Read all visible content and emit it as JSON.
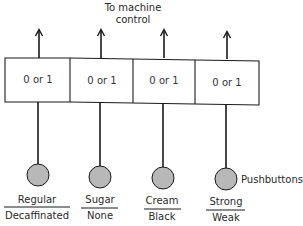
{
  "title": {
    "line1": "To machine control",
    "line1a": "To machine",
    "line2": "control"
  },
  "register": {
    "cells": [
      {
        "value": "0 or 1"
      },
      {
        "value": "0 or 1"
      },
      {
        "value": "0 or 1"
      },
      {
        "value": "0 or 1"
      }
    ]
  },
  "buttons": [
    {
      "top_label": "Regular",
      "bottom_label": "Decaffinated"
    },
    {
      "top_label": "Sugar",
      "bottom_label": "None"
    },
    {
      "top_label": "Cream",
      "bottom_label": "Black"
    },
    {
      "top_label": "Strong",
      "bottom_label": "Weak"
    }
  ],
  "pushbuttons_label": "Pushbuttons",
  "colors": {
    "button_fill": "#b8b8b8",
    "stroke": "#1a1a1a",
    "background": "#ffffff"
  }
}
